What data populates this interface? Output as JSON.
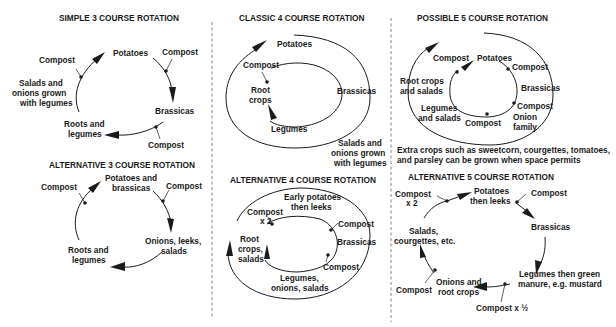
{
  "panels": {
    "simple3": {
      "title": "SIMPLE 3 COURSE ROTATION",
      "labels": {
        "potatoes": "Potatoes",
        "compost_a": "Compost",
        "brassicas": "Brassicas",
        "compost_b": "Compost",
        "roots1": "Roots and",
        "roots2": "legumes",
        "compost_c": "Compost",
        "note1": "Salads and",
        "note2": "onions grown",
        "note3": "with legumes"
      }
    },
    "alt3": {
      "title": "ALTERNATIVE 3 COURSE ROTATION",
      "labels": {
        "potatoes1": "Potatoes and",
        "potatoes2": "brassicas",
        "compost_a": "Compost",
        "onions1": "Onions, leeks,",
        "onions2": "salads",
        "roots1": "Roots and",
        "roots2": "legumes",
        "compost_b": "Compost"
      }
    },
    "classic4": {
      "title": "CLASSIC 4 COURSE ROTATION",
      "labels": {
        "potatoes": "Potatoes",
        "compost": "Compost",
        "root1": "Root",
        "root2": "crops",
        "brassicas": "Brassicas",
        "legumes": "Legumes",
        "note1": "Salads and",
        "note2": "onions grown",
        "note3": "with legumes"
      }
    },
    "alt4": {
      "title": "ALTERNATIVE 4 COURSE ROTATION",
      "labels": {
        "early1": "Early potatoes",
        "early2": "then leeks",
        "compost_x2_1": "Compost",
        "compost_x2_2": "x 2",
        "compost_a": "Compost",
        "brassicas": "Brassicas",
        "root1": "Root",
        "root2": "crops,",
        "root3": "salads",
        "compost_b": "Compost",
        "legumes1": "Legumes,",
        "legumes2": "onions, salads"
      }
    },
    "possible5": {
      "title": "POSSIBLE 5 COURSE ROTATION",
      "labels": {
        "compost_a": "Compost",
        "potatoes": "Potatoes",
        "compost_b": "Compost",
        "root1": "Root crops",
        "root2": "and salads",
        "brassicas": "Brassicas",
        "legumes1": "Legumes",
        "legumes2": "and salads",
        "compost_c": "Compost",
        "compost_d": "Compost",
        "onion1": "Onion",
        "onion2": "family",
        "note1": "Extra crops such as sweetcorn, courgettes, tomatoes,",
        "note2": "and parsley can be grown when space permits"
      }
    },
    "alt5": {
      "title": "ALTERNATIVE 5 COURSE ROTATION",
      "labels": {
        "compost_x2_1": "Compost",
        "compost_x2_2": "x 2",
        "potatoes1": "Potatoes",
        "potatoes2": "then leeks",
        "compost_a": "Compost",
        "brassicas": "Brassicas",
        "salads1": "Salads,",
        "salads2": "courgettes, etc.",
        "legumes1": "Legumes then green",
        "legumes2": "manure, e.g. mustard",
        "compost_b": "Compost",
        "onions1": "Onions and",
        "onions2": "root crops",
        "compost_half": "Compost x ½"
      }
    }
  }
}
